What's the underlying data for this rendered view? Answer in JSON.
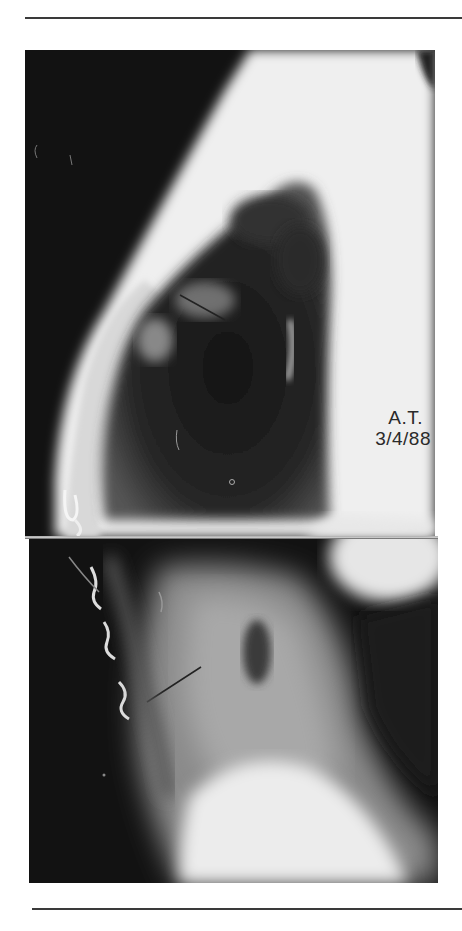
{
  "figure": {
    "type": "radiograph",
    "annotation": {
      "initials": "A.T.",
      "date": "3/4/88"
    },
    "colors": {
      "background": "#ffffff",
      "film_dark": "#111111",
      "tissue_light": "#f2f2f2",
      "rule": "#3a3a3a"
    }
  }
}
